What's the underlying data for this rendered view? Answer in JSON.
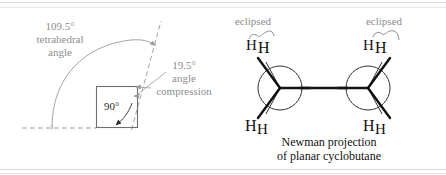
{
  "figure": {
    "title_caption_line1": "Newman projection",
    "title_caption_line2": "of planar cyclobutane",
    "colors": {
      "annotation_gray": "#8d8d8f",
      "ink_black": "#111111",
      "square_stroke": "#6f6f72",
      "frame_rule": "#d3d6dc"
    }
  },
  "left_panel": {
    "tetrahedral_label": {
      "value": "109.5°",
      "line2": "tetrahedral",
      "line3": "angle"
    },
    "compression_label": {
      "value": "19.5°",
      "line2": "angle",
      "line3": "compression"
    },
    "square_angle_label": "90°"
  },
  "right_panel": {
    "eclipsed_left": "eclipsed",
    "eclipsed_right": "eclipsed",
    "hydrogens": {
      "front_left_top": "H",
      "back_left_top": "H",
      "front_left_bottom": "H",
      "back_left_bottom": "H",
      "front_right_top": "H",
      "back_right_top": "H",
      "front_right_bottom": "H",
      "back_right_bottom": "H"
    }
  }
}
